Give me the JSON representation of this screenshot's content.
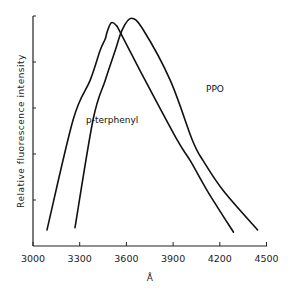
{
  "chart_data": {
    "type": "line",
    "title": "",
    "xlabel": "Å",
    "ylabel": "Relative fluorescence intensity",
    "xlim": [
      3000,
      4500
    ],
    "ylim": [
      0,
      1
    ],
    "x_ticks": [
      3000,
      3300,
      3600,
      3900,
      4200,
      4500
    ],
    "x_tick_labels": [
      "3000",
      "3300",
      "3600",
      "3900",
      "4200",
      "4500"
    ],
    "y_ticks": [
      0.2,
      0.4,
      0.6,
      0.8,
      1.0
    ],
    "y_tick_labels": [],
    "grid": false,
    "legend": "inline labels",
    "series": [
      {
        "name": "p-terphenyl",
        "x": [
          3090,
          3258,
          3367,
          3431,
          3464,
          3476,
          3502,
          3534,
          3567,
          3721,
          3927,
          4011,
          4120,
          4288
        ],
        "values": [
          0.07,
          0.55,
          0.72,
          0.85,
          0.9,
          0.93,
          0.97,
          0.96,
          0.92,
          0.72,
          0.46,
          0.37,
          0.24,
          0.06
        ]
      },
      {
        "name": "PPO",
        "x": [
          3270,
          3386,
          3464,
          3528,
          3573,
          3631,
          3708,
          3882,
          4024,
          4094,
          4223,
          4442
        ],
        "values": [
          0.08,
          0.55,
          0.72,
          0.85,
          0.94,
          0.99,
          0.94,
          0.72,
          0.46,
          0.37,
          0.24,
          0.07
        ]
      }
    ],
    "annotations": [
      {
        "text": "PPO",
        "x": 3880,
        "y": 0.69
      },
      {
        "text": "p-terphenyl",
        "x": 3540,
        "y": 0.58
      }
    ]
  },
  "labels": {
    "x_axis_title": "Å",
    "y_axis_title": "Relative fluorescence intensity",
    "ppo": "PPO",
    "pterphenyl": "p-terphenyl"
  }
}
